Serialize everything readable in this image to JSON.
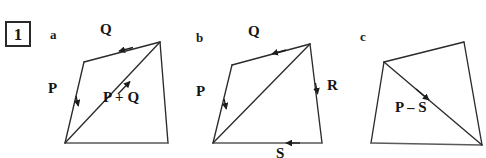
{
  "question_number": "1",
  "panels": [
    {
      "letter": "a",
      "labels": {
        "q": "Q",
        "p": "P",
        "resultant": "P + Q"
      }
    },
    {
      "letter": "b",
      "labels": {
        "q": "Q",
        "p": "P",
        "r": "R",
        "s": "S"
      }
    },
    {
      "letter": "c",
      "labels": {
        "resultant": "P – S"
      }
    }
  ],
  "colors": {
    "stroke": "#2b2b2b",
    "text": "#141414",
    "background": "#ffffff",
    "box_border": "#2a2a2a"
  }
}
